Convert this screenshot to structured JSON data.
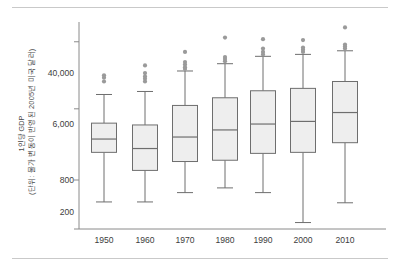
{
  "axis": {
    "y_label_outer": "(단위: 물가 변동이 반영된 2005년 미국 달러)",
    "y_label_inner": "1인당 GDP",
    "y_ticks": [
      "40,000",
      "6,000",
      "800",
      "200"
    ],
    "x_ticks": [
      "1950",
      "1960",
      "1970",
      "1980",
      "1990",
      "2000",
      "2010"
    ]
  },
  "style": {
    "box_fill": "#eeeeee",
    "box_stroke": "#6e6e6e",
    "whisker_stroke": "#6e6e6e",
    "outlier_fill": "#9a9a9a",
    "axis_stroke": "#8a8a8a",
    "rule_color": "#c9c9c9"
  },
  "chart_data": {
    "type": "box",
    "title": "",
    "xlabel": "",
    "ylabel": "1인당 GDP (단위: 물가 변동이 반영된 2005년 미국 달러)",
    "yscale": "log",
    "ylim": [
      200,
      70000
    ],
    "ytick_values": [
      40000,
      6000,
      800,
      200
    ],
    "ytick_labels": [
      "40,000",
      "6,000",
      "800",
      "200"
    ],
    "grid": false,
    "legend": "none",
    "categories": [
      "1950",
      "1960",
      "1970",
      "1980",
      "1990",
      "2000",
      "2010"
    ],
    "boxes": [
      {
        "category": "1950",
        "whisker_low": 430,
        "q1": 1750,
        "median": 2550,
        "q3": 4000,
        "whisker_high": 9000,
        "outliers": [
          13000,
          14500,
          15500
        ]
      },
      {
        "category": "1960",
        "whisker_low": 430,
        "q1": 1050,
        "median": 1950,
        "q3": 3800,
        "whisker_high": 9800,
        "outliers": [
          13000,
          14000,
          15000,
          16500,
          20500
        ]
      },
      {
        "category": "1970",
        "whisker_low": 560,
        "q1": 1350,
        "median": 2700,
        "q3": 6600,
        "whisker_high": 17500,
        "outliers": [
          18500,
          19500,
          21000,
          22500,
          30000
        ]
      },
      {
        "category": "1980",
        "whisker_low": 640,
        "q1": 1400,
        "median": 3300,
        "q3": 8200,
        "whisker_high": 21500,
        "outliers": [
          23000,
          24500,
          26000,
          45000
        ]
      },
      {
        "category": "1990",
        "whisker_low": 560,
        "q1": 1700,
        "median": 3900,
        "q3": 10000,
        "whisker_high": 26500,
        "outliers": [
          28000,
          30000,
          33000,
          43000
        ]
      },
      {
        "category": "2000",
        "whisker_low": 240,
        "q1": 1750,
        "median": 4200,
        "q3": 10700,
        "whisker_high": 28000,
        "outliers": [
          30000,
          32000,
          34000,
          42000
        ]
      },
      {
        "category": "2010",
        "whisker_low": 420,
        "q1": 2300,
        "median": 5400,
        "q3": 13000,
        "whisker_high": 31000,
        "outliers": [
          33000,
          35000,
          37000,
          60000
        ]
      }
    ]
  }
}
